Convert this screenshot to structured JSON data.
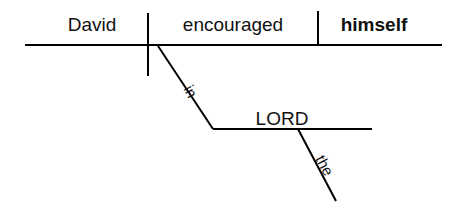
{
  "diagram": {
    "type": "reed-kellogg-sentence-diagram",
    "sentence": "David encouraged himself in the LORD",
    "background_color": "#ffffff",
    "line_color": "#000000",
    "text_color": "#111111",
    "words": {
      "subject": "David",
      "verb": "encouraged",
      "direct_object": "himself",
      "preposition": "in",
      "object_of_preposition": "LORD",
      "article": "the"
    },
    "labels": [
      {
        "key": "subject",
        "text": "David",
        "x": 92,
        "y": 31,
        "anchor": "middle",
        "bold": false,
        "size": 19,
        "rotate": 0
      },
      {
        "key": "verb",
        "text": "encouraged",
        "x": 233,
        "y": 31,
        "anchor": "middle",
        "bold": false,
        "size": 19,
        "rotate": 0
      },
      {
        "key": "direct_object",
        "text": "himself",
        "x": 374,
        "y": 31,
        "anchor": "middle",
        "bold": true,
        "size": 19,
        "rotate": 0
      },
      {
        "key": "object_of_preposition",
        "text": "LORD",
        "x": 282,
        "y": 125,
        "anchor": "middle",
        "bold": false,
        "size": 19,
        "rotate": 0
      },
      {
        "key": "preposition",
        "text": "in",
        "x": 186,
        "y": 94,
        "anchor": "middle",
        "bold": false,
        "size": 15,
        "rotate": 62
      },
      {
        "key": "article",
        "text": "the",
        "x": 320,
        "y": 168,
        "anchor": "middle",
        "bold": false,
        "size": 15,
        "rotate": 62
      }
    ],
    "lines": [
      {
        "key": "baseline",
        "x1": 25,
        "y1": 45,
        "x2": 442,
        "y2": 45,
        "width": 2
      },
      {
        "key": "subject-verb-divider",
        "x1": 148,
        "y1": 13,
        "x2": 148,
        "y2": 76,
        "width": 2
      },
      {
        "key": "direct-object-divider",
        "x1": 318,
        "y1": 11,
        "x2": 318,
        "y2": 45,
        "width": 2
      },
      {
        "key": "preposition-slant",
        "x1": 158,
        "y1": 46,
        "x2": 213,
        "y2": 129,
        "width": 2
      },
      {
        "key": "prepositional-object-line",
        "x1": 213,
        "y1": 129,
        "x2": 372,
        "y2": 129,
        "width": 2
      },
      {
        "key": "article-slant",
        "x1": 298,
        "y1": 129,
        "x2": 336,
        "y2": 201,
        "width": 2
      }
    ]
  }
}
